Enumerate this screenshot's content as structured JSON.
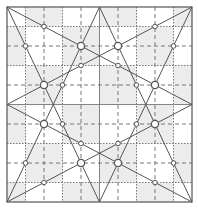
{
  "diagram": {
    "type": "geometric-construction-grid",
    "grid": {
      "columns": 10,
      "rows": 10,
      "frame": {
        "x": 7,
        "y": 7,
        "width": 185,
        "height": 195
      },
      "line_styles": {
        "odd": "dotted",
        "even": "dashed",
        "center": "solid"
      },
      "shade_color": "#ececec",
      "line_color": "#777777",
      "frame_color": "#555555"
    },
    "lines": [
      {
        "from": [
          0,
          0
        ],
        "to": [
          10,
          5
        ]
      },
      {
        "from": [
          0,
          0
        ],
        "to": [
          5,
          10
        ]
      },
      {
        "from": [
          10,
          0
        ],
        "to": [
          0,
          5
        ]
      },
      {
        "from": [
          10,
          0
        ],
        "to": [
          5,
          10
        ]
      },
      {
        "from": [
          0,
          10
        ],
        "to": [
          10,
          5
        ]
      },
      {
        "from": [
          0,
          10
        ],
        "to": [
          5,
          0
        ]
      },
      {
        "from": [
          10,
          10
        ],
        "to": [
          0,
          5
        ]
      },
      {
        "from": [
          10,
          10
        ],
        "to": [
          5,
          0
        ]
      }
    ],
    "large_points": [
      [
        4,
        2
      ],
      [
        6,
        2
      ],
      [
        2,
        4
      ],
      [
        8,
        4
      ],
      [
        2,
        6
      ],
      [
        8,
        6
      ],
      [
        4,
        8
      ],
      [
        6,
        8
      ]
    ],
    "small_points": [
      [
        2,
        1
      ],
      [
        8,
        1
      ],
      [
        1,
        2
      ],
      [
        9,
        2
      ],
      [
        4,
        3
      ],
      [
        6,
        3
      ],
      [
        3,
        4
      ],
      [
        7,
        4
      ],
      [
        3,
        6
      ],
      [
        7,
        6
      ],
      [
        4,
        7
      ],
      [
        6,
        7
      ],
      [
        1,
        8
      ],
      [
        9,
        8
      ],
      [
        2,
        9
      ],
      [
        8,
        9
      ]
    ],
    "colors": {
      "stroke": "#555555",
      "point_fill": "#ffffff"
    }
  }
}
